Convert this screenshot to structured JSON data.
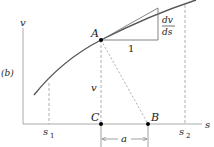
{
  "diagram": {
    "panel_label": "(b)",
    "axes": {
      "y_label": "v",
      "x_label": "s"
    },
    "points": {
      "A": "A",
      "B": "B",
      "C": "C"
    },
    "ticks": {
      "s1": "s",
      "s1_sub": "1",
      "s2": "s",
      "s2_sub": "2"
    },
    "segment_labels": {
      "AC": "v",
      "CB": "a"
    },
    "slope_triangle": {
      "run": "1",
      "rise_num": "dv",
      "rise_den": "ds"
    },
    "colors": {
      "curve": "#444444",
      "axis": "#999999",
      "dash": "#888888",
      "point": "#000000"
    }
  }
}
